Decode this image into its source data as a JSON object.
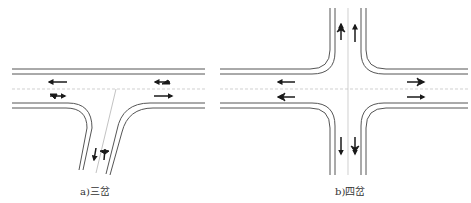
{
  "figure": {
    "panels": [
      {
        "id": "a",
        "caption": "a)三岔",
        "type": "three-way-intersection",
        "approaches": [
          "west",
          "east",
          "south"
        ],
        "lane_arrows": [
          {
            "approach": "west-upper",
            "direction": "left-pointing straight"
          },
          {
            "approach": "west-lower",
            "direction": "straight-and-right-turn"
          },
          {
            "approach": "east-upper",
            "direction": "straight-and-left-turn"
          },
          {
            "approach": "east-lower",
            "direction": "right-pointing straight"
          },
          {
            "approach": "south-left",
            "direction": "down-pointing straight"
          },
          {
            "approach": "south-right",
            "direction": "left-and-right-turn"
          }
        ]
      },
      {
        "id": "b",
        "caption": "b)四岔",
        "type": "four-way-intersection",
        "approaches": [
          "west",
          "east",
          "north",
          "south"
        ],
        "lane_arrows": [
          {
            "approach": "north-left",
            "direction": "straight-left-right"
          },
          {
            "approach": "north-right",
            "direction": "up-pointing straight"
          },
          {
            "approach": "west-upper",
            "direction": "left-pointing straight"
          },
          {
            "approach": "west-lower",
            "direction": "straight-left-right"
          },
          {
            "approach": "east-upper",
            "direction": "straight-left-right"
          },
          {
            "approach": "east-lower",
            "direction": "right-pointing straight"
          },
          {
            "approach": "south-left",
            "direction": "down-pointing straight"
          },
          {
            "approach": "south-right",
            "direction": "straight-left-right"
          }
        ]
      }
    ],
    "colors": {
      "road_edge": "#555555",
      "centerline": "#bbbbbb",
      "arrow": "#1a1a1a"
    }
  }
}
